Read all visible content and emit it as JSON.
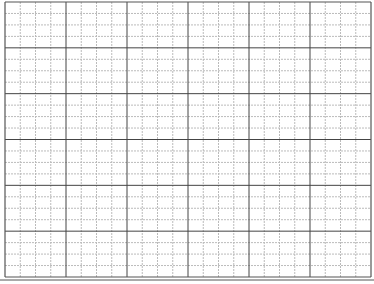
{
  "grid": {
    "background": "#ffffff",
    "left": 5,
    "top": 2,
    "right": 371,
    "bottom": 277,
    "major_columns": 6,
    "major_rows": 6,
    "minor_per_major_x": 4,
    "minor_per_major_y": 4,
    "major_color": "#444444",
    "minor_color": "#bbbbbb",
    "frame_color": "#555555",
    "bottom_double_line": true
  }
}
